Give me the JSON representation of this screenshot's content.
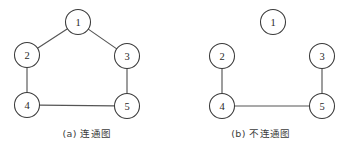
{
  "figure": {
    "background_color": "#ffffff",
    "node_stroke_color": "#3a3a3a",
    "edge_color": "#555555",
    "label_color": "#2a2a2a"
  },
  "panels": [
    {
      "id": "a",
      "caption": "(a) 连通图",
      "node_radius": 12.5,
      "nodes": [
        {
          "id": "1",
          "label": "1",
          "cx": 78,
          "cy": 22
        },
        {
          "id": "2",
          "label": "2",
          "cx": 27,
          "cy": 55
        },
        {
          "id": "3",
          "label": "3",
          "cx": 127,
          "cy": 56
        },
        {
          "id": "4",
          "label": "4",
          "cx": 27,
          "cy": 105
        },
        {
          "id": "5",
          "label": "5",
          "cx": 127,
          "cy": 106
        }
      ],
      "edges": [
        {
          "from": "1",
          "to": "2"
        },
        {
          "from": "1",
          "to": "3"
        },
        {
          "from": "2",
          "to": "4"
        },
        {
          "from": "3",
          "to": "5"
        },
        {
          "from": "4",
          "to": "5"
        }
      ]
    },
    {
      "id": "b",
      "caption": "(b) 不连通图",
      "node_radius": 12.5,
      "nodes": [
        {
          "id": "1",
          "label": "1",
          "cx": 99,
          "cy": 22
        },
        {
          "id": "2",
          "label": "2",
          "cx": 48,
          "cy": 56
        },
        {
          "id": "3",
          "label": "3",
          "cx": 148,
          "cy": 56
        },
        {
          "id": "4",
          "label": "4",
          "cx": 48,
          "cy": 106
        },
        {
          "id": "5",
          "label": "5",
          "cx": 148,
          "cy": 106
        }
      ],
      "edges": [
        {
          "from": "2",
          "to": "4"
        },
        {
          "from": "3",
          "to": "5"
        },
        {
          "from": "4",
          "to": "5"
        }
      ]
    }
  ]
}
